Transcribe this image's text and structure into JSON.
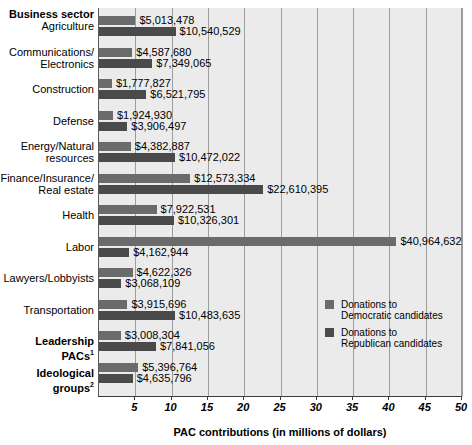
{
  "header": {
    "row_header_label": "Business sector"
  },
  "legend": {
    "position": "inside-right-middle",
    "entries": [
      {
        "label_line1": "Donations to",
        "label_line2": "Democratic candidates",
        "color": "#6b6b6b",
        "key": "democratic"
      },
      {
        "label_line1": "Donations to",
        "label_line2": "Republican candidates",
        "color": "#4a4a4a",
        "key": "republican"
      }
    ]
  },
  "axis": {
    "title": "PAC contributions (in millions of dollars)",
    "ticks": [
      "5",
      "10",
      "15",
      "20",
      "25",
      "30",
      "35",
      "40",
      "45",
      "50"
    ],
    "tick_values": [
      5,
      10,
      15,
      20,
      25,
      30,
      35,
      40,
      45,
      50
    ],
    "range": [
      0,
      50
    ]
  },
  "chart_data": {
    "type": "bar",
    "orientation": "horizontal",
    "title": "",
    "xlabel": "PAC contributions (in millions of dollars)",
    "ylabel": "Business sector",
    "xlim": [
      0,
      50
    ],
    "grid": true,
    "legend_position": "inside-right-middle",
    "categories": [
      "Agriculture",
      "Communications/ Electronics",
      "Construction",
      "Defense",
      "Energy/Natural resources",
      "Finance/Insurance/ Real estate",
      "Health",
      "Labor",
      "Lawyers/Lobbyists",
      "Transportation",
      "Leadership PACs",
      "Ideological groups"
    ],
    "series": [
      {
        "name": "Donations to Democratic candidates",
        "color": "#6b6b6b",
        "values": [
          5013478,
          4587680,
          1777827,
          1924930,
          4382887,
          12573334,
          7922531,
          40964632,
          4622326,
          3915696,
          3008304,
          5396764
        ],
        "labels": [
          "$5,013,478",
          "$4,587,680",
          "$1,777,827",
          "$1,924,930",
          "$4,382,887",
          "$12,573,334",
          "$7,922,531",
          "$40,964,632",
          "$4,622,326",
          "$3,915,696",
          "$3,008,304",
          "$5,396,764"
        ]
      },
      {
        "name": "Donations to Republican candidates",
        "color": "#4a4a4a",
        "values": [
          10540529,
          7349065,
          6521795,
          3906497,
          10472022,
          22610395,
          10326301,
          4162944,
          3068109,
          10483635,
          7841056,
          4635796
        ],
        "labels": [
          "$10,540,529",
          "$7,349,065",
          "$6,521,795",
          "$3,906,497",
          "$10,472,022",
          "$22,610,395",
          "$10,326,301",
          "$4,162,944",
          "$3,068,109",
          "$10,483,635",
          "$7,841,056",
          "$4,635,796"
        ]
      }
    ]
  },
  "rows": [
    {
      "label_lines": [
        "Agriculture"
      ],
      "bold": false,
      "footnote": ""
    },
    {
      "label_lines": [
        "Communications/",
        "Electronics"
      ],
      "bold": false,
      "footnote": ""
    },
    {
      "label_lines": [
        "Construction"
      ],
      "bold": false,
      "footnote": ""
    },
    {
      "label_lines": [
        "Defense"
      ],
      "bold": false,
      "footnote": ""
    },
    {
      "label_lines": [
        "Energy/Natural",
        "resources"
      ],
      "bold": false,
      "footnote": ""
    },
    {
      "label_lines": [
        "Finance/Insurance/",
        "Real estate"
      ],
      "bold": false,
      "footnote": ""
    },
    {
      "label_lines": [
        "Health"
      ],
      "bold": false,
      "footnote": ""
    },
    {
      "label_lines": [
        "Labor"
      ],
      "bold": false,
      "footnote": ""
    },
    {
      "label_lines": [
        "Lawyers/Lobbyists"
      ],
      "bold": false,
      "footnote": ""
    },
    {
      "label_lines": [
        "Transportation"
      ],
      "bold": false,
      "footnote": ""
    },
    {
      "label_lines": [
        "Leadership PACs"
      ],
      "bold": true,
      "footnote": "1"
    },
    {
      "label_lines": [
        "Ideological groups"
      ],
      "bold": true,
      "footnote": "2"
    }
  ]
}
